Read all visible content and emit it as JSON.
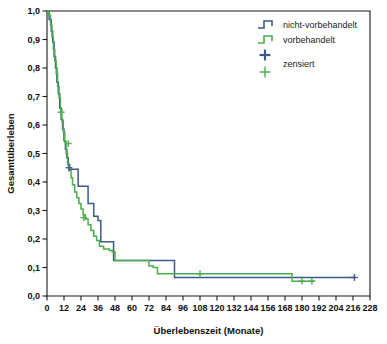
{
  "chart_data": {
    "type": "line",
    "subtype": "kaplan-meier-step",
    "title": "",
    "xlabel": "Überlebenszeit (Monate)",
    "ylabel": "Gesamtüberleben",
    "xlim": [
      0,
      228
    ],
    "ylim": [
      0,
      1.0
    ],
    "grid": false,
    "legend_position": "top-right",
    "xticks": [
      0,
      12,
      24,
      36,
      48,
      60,
      72,
      84,
      96,
      108,
      120,
      132,
      144,
      156,
      168,
      180,
      192,
      204,
      216,
      228
    ],
    "xtick_labels": [
      "0",
      "12",
      "24",
      "36",
      "48",
      "60",
      "72",
      "84",
      "96",
      "108",
      "120",
      "132",
      "144",
      "156",
      "168",
      "180",
      "192",
      "204",
      "216",
      "228"
    ],
    "yticks": [
      0.0,
      0.1,
      0.2,
      0.3,
      0.4,
      0.5,
      0.6,
      0.7,
      0.8,
      0.9,
      1.0
    ],
    "ytick_labels": [
      "0,0",
      "0,1",
      "0,2",
      "0,3",
      "0,4",
      "0,5",
      "0,6",
      "0,7",
      "0,8",
      "0,9",
      "1,0"
    ],
    "series": [
      {
        "name": "nicht-vorbehandelt",
        "color": "#3d5a8a",
        "points": [
          [
            0,
            1.0
          ],
          [
            1.5,
            0.97
          ],
          [
            3,
            0.93
          ],
          [
            4,
            0.89
          ],
          [
            5,
            0.84
          ],
          [
            6,
            0.8
          ],
          [
            7,
            0.75
          ],
          [
            8,
            0.71
          ],
          [
            9,
            0.66
          ],
          [
            10,
            0.62
          ],
          [
            11,
            0.585
          ],
          [
            12,
            0.545
          ],
          [
            13,
            0.515
          ],
          [
            14,
            0.485
          ],
          [
            15,
            0.46
          ],
          [
            16,
            0.445
          ],
          [
            17,
            0.445
          ],
          [
            21,
            0.445
          ],
          [
            22,
            0.385
          ],
          [
            28,
            0.385
          ],
          [
            29,
            0.325
          ],
          [
            32,
            0.325
          ],
          [
            33,
            0.28
          ],
          [
            36,
            0.265
          ],
          [
            38,
            0.19
          ],
          [
            44,
            0.19
          ],
          [
            45,
            0.19
          ],
          [
            47,
            0.125
          ],
          [
            49,
            0.125
          ],
          [
            73,
            0.125
          ],
          [
            74,
            0.125
          ],
          [
            89,
            0.125
          ],
          [
            90,
            0.065
          ],
          [
            217,
            0.065
          ]
        ],
        "censored": [
          [
            15.5,
            0.45
          ],
          [
            217,
            0.065
          ]
        ]
      },
      {
        "name": "vorbehandelt",
        "color": "#4cae4c",
        "points": [
          [
            0,
            1.0
          ],
          [
            1.2,
            0.985
          ],
          [
            2.5,
            0.95
          ],
          [
            3.5,
            0.91
          ],
          [
            4.5,
            0.865
          ],
          [
            5.5,
            0.825
          ],
          [
            6.5,
            0.78
          ],
          [
            7.5,
            0.735
          ],
          [
            8.5,
            0.695
          ],
          [
            9.5,
            0.655
          ],
          [
            10.5,
            0.615
          ],
          [
            11.5,
            0.575
          ],
          [
            12.5,
            0.54
          ],
          [
            13.5,
            0.5
          ],
          [
            14.5,
            0.465
          ],
          [
            15.5,
            0.44
          ],
          [
            17,
            0.415
          ],
          [
            18,
            0.39
          ],
          [
            19.5,
            0.365
          ],
          [
            21,
            0.345
          ],
          [
            22.5,
            0.325
          ],
          [
            24,
            0.305
          ],
          [
            25.5,
            0.285
          ],
          [
            27,
            0.27
          ],
          [
            29,
            0.25
          ],
          [
            31,
            0.23
          ],
          [
            33,
            0.21
          ],
          [
            35,
            0.195
          ],
          [
            37,
            0.175
          ],
          [
            40,
            0.165
          ],
          [
            44,
            0.16
          ],
          [
            46,
            0.155
          ],
          [
            48,
            0.125
          ],
          [
            62,
            0.125
          ],
          [
            72,
            0.105
          ],
          [
            75,
            0.1
          ],
          [
            78,
            0.078
          ],
          [
            172,
            0.078
          ],
          [
            173,
            0.052
          ],
          [
            189,
            0.052
          ]
        ],
        "censored": [
          [
            10,
            0.645
          ],
          [
            15,
            0.535
          ],
          [
            26,
            0.275
          ],
          [
            108,
            0.078
          ],
          [
            180,
            0.052
          ],
          [
            187,
            0.052
          ]
        ]
      }
    ],
    "legend": [
      {
        "label": "nicht-vorbehandelt",
        "type": "step",
        "color": "#3d5a8a"
      },
      {
        "label": "vorbehandelt",
        "type": "step",
        "color": "#4cae4c"
      },
      {
        "label": "zensiert",
        "type": "censor-pair",
        "colors": [
          "#3d5a8a",
          "#4cae4c"
        ]
      }
    ]
  },
  "colors": {
    "series_blue": "#3d5a8a",
    "series_green": "#4cae4c",
    "axis": "#1a1a1a",
    "background": "#ffffff"
  }
}
